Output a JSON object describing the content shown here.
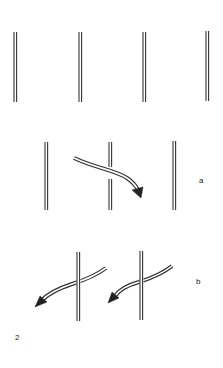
{
  "figure": {
    "number_label": "2",
    "panels": [
      {
        "id": "top",
        "label": "",
        "rods_x": [
          15,
          80,
          144,
          207
        ],
        "rod_y": [
          32,
          102
        ]
      },
      {
        "id": "a",
        "label": "a",
        "rods_x": [
          46,
          110,
          174
        ],
        "rod_y": [
          142,
          210
        ],
        "arrows": [
          {
            "from": [
              74,
              159
            ],
            "to": [
              141,
              197
            ],
            "over_rod": true
          }
        ]
      },
      {
        "id": "b",
        "label": "b",
        "rods_x": [
          78,
          141
        ],
        "rod_y": [
          252,
          321
        ],
        "arrows": [
          {
            "from": [
              106,
              267
            ],
            "to": [
              36,
              306
            ],
            "over_rod": false
          },
          {
            "from": [
              172,
              266
            ],
            "to": [
              109,
              302
            ],
            "over_rod": false
          }
        ]
      }
    ]
  },
  "colors": {
    "line": "#333333",
    "background": "#ffffff"
  }
}
